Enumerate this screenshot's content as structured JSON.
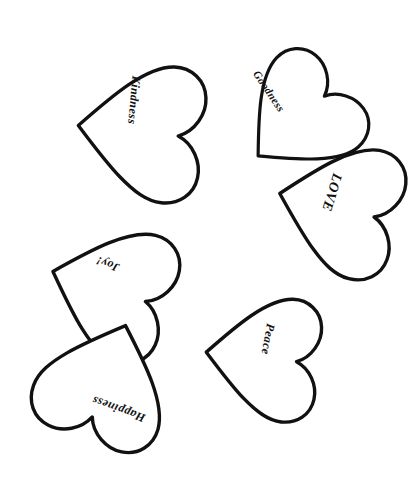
{
  "page": {
    "background_color": "#ffffff",
    "width": 417,
    "height": 482,
    "stroke_color": "#111111",
    "fill_color": "#ffffff",
    "text_color": "#111111"
  },
  "hearts": [
    {
      "id": "kindness",
      "label": "Kindness",
      "label_rotation": 95,
      "label_x": 133,
      "label_y": 100,
      "font_size": 12,
      "shape_rotation": 96,
      "center_x": 140,
      "center_y": 132,
      "scale": 0.62,
      "stroke_width": 3.4,
      "z": 1
    },
    {
      "id": "goodness",
      "label": "Goodness",
      "label_rotation": 56,
      "label_x": 268,
      "label_y": 92,
      "font_size": 11,
      "shape_rotation": 48,
      "center_x": 299,
      "center_y": 119,
      "scale": 0.55,
      "stroke_width": 3.2,
      "z": 2
    },
    {
      "id": "love",
      "label": "LOVE",
      "label_rotation": 107,
      "label_x": 331,
      "label_y": 192,
      "font_size": 14,
      "shape_rotation": 104,
      "center_x": 338,
      "center_y": 208,
      "scale": 0.6,
      "stroke_width": 3.4,
      "z": 3
    },
    {
      "id": "joy",
      "label": "Joy!",
      "label_rotation": 200,
      "label_x": 108,
      "label_y": 263,
      "font_size": 12,
      "shape_rotation": 108,
      "center_x": 110,
      "center_y": 290,
      "scale": 0.6,
      "stroke_width": 3.4,
      "z": 4
    },
    {
      "id": "happiness",
      "label": "Happiness",
      "label_rotation": 200,
      "label_x": 119,
      "label_y": 408,
      "font_size": 12,
      "shape_rotation": 200,
      "center_x": 105,
      "center_y": 382,
      "scale": 0.6,
      "stroke_width": 3.4,
      "z": 5
    },
    {
      "id": "peace",
      "label": "Peace",
      "label_rotation": 100,
      "label_x": 267,
      "label_y": 339,
      "font_size": 12,
      "shape_rotation": 96,
      "center_x": 262,
      "center_y": 358,
      "scale": 0.56,
      "stroke_width": 3.4,
      "z": 6
    }
  ]
}
